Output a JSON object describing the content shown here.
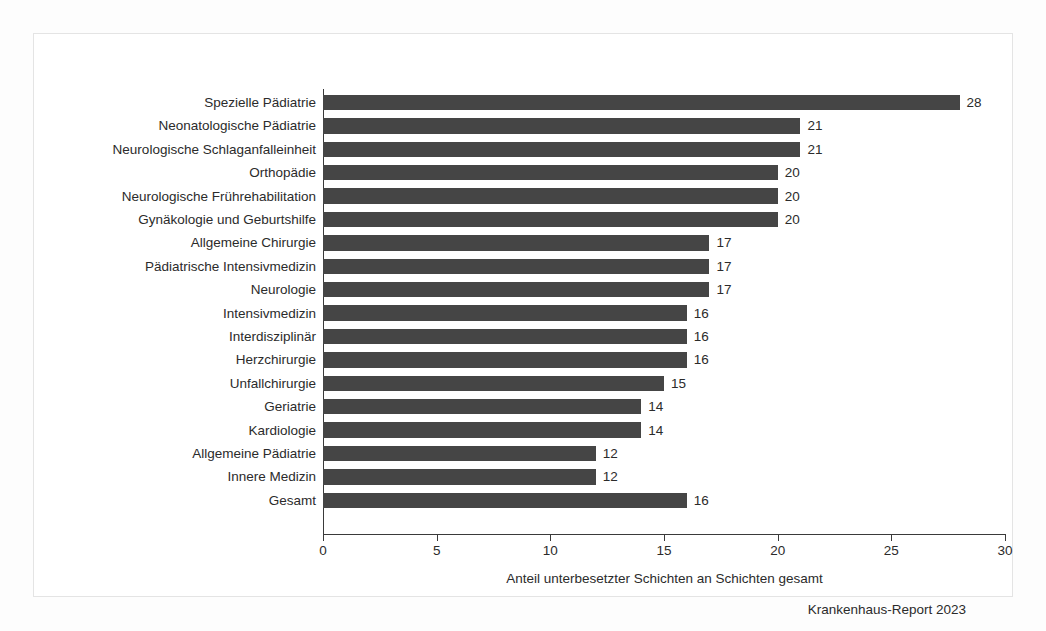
{
  "chart_data": {
    "type": "bar",
    "orientation": "horizontal",
    "title": "",
    "xlabel": "Anteil unterbesetzter Schichten an Schichten gesamt",
    "ylabel": "",
    "xlim": [
      0,
      30
    ],
    "xticks": [
      0,
      5,
      10,
      15,
      20,
      25,
      30
    ],
    "grid": false,
    "legend": null,
    "bar_color": "#454545",
    "categories": [
      "Spezielle Pädiatrie",
      "Neonatologische Pädiatrie",
      "Neurologische Schlaganfalleinheit",
      "Orthopädie",
      "Neurologische Frührehabilitation",
      "Gynäkologie und Geburtshilfe",
      "Allgemeine Chirurgie",
      "Pädiatrische Intensivmedizin",
      "Neurologie",
      "Intensivmedizin",
      "Interdisziplinär",
      "Herzchirurgie",
      "Unfallchirurgie",
      "Geriatrie",
      "Kardiologie",
      "Allgemeine Pädiatrie",
      "Innere Medizin",
      "Gesamt"
    ],
    "values": [
      28,
      21,
      21,
      20,
      20,
      20,
      17,
      17,
      17,
      16,
      16,
      16,
      15,
      14,
      14,
      12,
      12,
      16
    ],
    "value_labels": [
      "28",
      "21",
      "21",
      "20",
      "20",
      "20",
      "17",
      "17",
      "17",
      "16",
      "16",
      "16",
      "15",
      "14",
      "14",
      "12",
      "12",
      "16"
    ]
  },
  "footer": {
    "source": "Krankenhaus-Report 2023"
  }
}
